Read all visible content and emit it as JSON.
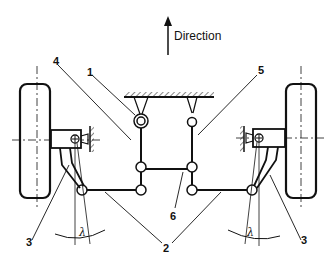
{
  "diagram": {
    "direction_label": "Direction",
    "angle_symbol": "λ",
    "callouts": {
      "c1": "1",
      "c2": "2",
      "c3_left": "3",
      "c3_right": "3",
      "c4": "4",
      "c5": "5",
      "c6": "6"
    },
    "parts": [
      {
        "id": "1",
        "name": "steering box / pitman arm pivot"
      },
      {
        "id": "2",
        "name": "tie rods"
      },
      {
        "id": "3",
        "name": "steering arms"
      },
      {
        "id": "4",
        "name": "pitman arm"
      },
      {
        "id": "5",
        "name": "idler arm"
      },
      {
        "id": "6",
        "name": "center link"
      }
    ],
    "colors": {
      "ink": "#111111",
      "background": "#ffffff"
    }
  }
}
